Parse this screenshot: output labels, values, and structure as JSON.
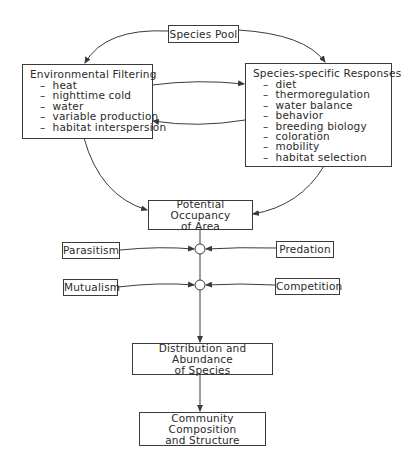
{
  "diagram": {
    "species_pool": "Species Pool",
    "environmental_filtering": {
      "title": "Environmental Filtering",
      "items": [
        "heat",
        "nighttime cold",
        "water",
        "variable production",
        "habitat interspersion"
      ]
    },
    "species_specific": {
      "title": "Species-specific Responses",
      "items": [
        "diet",
        "thermoregulation",
        "water balance",
        "behavior",
        "breeding biology",
        "coloration",
        "mobility",
        "habitat selection"
      ]
    },
    "potential_occupancy": [
      "Potential Occupancy",
      "of Area"
    ],
    "parasitism": "Parasitism",
    "predation": "Predation",
    "mutualism": "Mutualism",
    "competition": "Competition",
    "distribution": [
      "Distribution and Abundance",
      "of Species"
    ],
    "community": [
      "Community Composition",
      "and Structure"
    ],
    "colors": {
      "line": "#3a3a3a",
      "background": "#ffffff"
    }
  }
}
